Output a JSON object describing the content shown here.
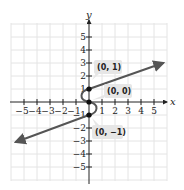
{
  "diagram": {
    "type": "coordinate-graph",
    "axes": {
      "x_label": "x",
      "y_label": "y",
      "x_ticks": [
        "−5",
        "−4",
        "−3",
        "−2",
        "−1",
        "1",
        "2",
        "3",
        "4",
        "5"
      ],
      "y_ticks": [
        "5",
        "4",
        "3",
        "2",
        "1",
        "−1",
        "−2",
        "−3",
        "−4",
        "−5"
      ],
      "range": [
        -5.5,
        5.5
      ]
    },
    "points": [
      {
        "label": "(0, 1)",
        "x": 0,
        "y": 1
      },
      {
        "label": "(0, 0)",
        "x": 0,
        "y": 0
      },
      {
        "label": "(0, −1)",
        "x": 0,
        "y": -1
      }
    ],
    "curves": [
      {
        "name": "upper-ray",
        "from": [
          0,
          1
        ],
        "to": [
          5.9,
          3
        ],
        "arrow": true
      },
      {
        "name": "lower-ray",
        "from": [
          0,
          -1
        ],
        "to": [
          -5.7,
          -3
        ],
        "arrow": true
      },
      {
        "name": "s-curve",
        "through": [
          [
            0,
            1
          ],
          [
            0,
            0
          ],
          [
            0,
            -1
          ]
        ]
      }
    ],
    "colors": {
      "curve": "#555555",
      "grid": "#e4e4e4",
      "axis": "#222222",
      "label_bg": "#e6e6e6"
    }
  }
}
